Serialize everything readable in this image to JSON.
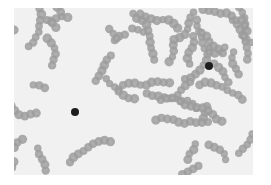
{
  "image": {
    "subject": "blood smear micrograph",
    "description": "Grayscale micrograph of red blood cells forming chains (rouleaux) with two dark stained cells",
    "colors": {
      "background": "#ffffff",
      "field": "#f1f1f1",
      "cell": "#9c9c9c",
      "cell_center": "#b4b4b4",
      "dark_cell": "#1e1e1e"
    },
    "dark_cells": [
      {
        "x": 75,
        "y": 112,
        "r": 4
      },
      {
        "x": 209,
        "y": 66,
        "r": 4
      }
    ]
  }
}
